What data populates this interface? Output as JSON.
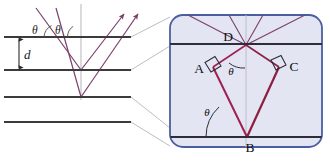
{
  "figure": {
    "colors": {
      "plane_line": "#3b3b3b",
      "ray": "#7b3f6b",
      "ray_dark": "#8c2244",
      "normal": "#b9b9bd",
      "panel_border": "#4a5fa0",
      "panel_fill": "#e2e4f2",
      "leader": "#b0b0b8",
      "text": "#1a1a1a"
    },
    "left_panel": {
      "name": "crystal-planes-diagram",
      "spacing_label": "d",
      "incident_angle_label_1": "θ",
      "incident_angle_label_2": "θ",
      "plane_count": 4,
      "incoming_ray_count": 2,
      "outgoing_ray_count": 2,
      "normal_line": "vertical dashed normal"
    },
    "right_panel": {
      "name": "magnified-path-difference-detail",
      "points": [
        {
          "id": "A",
          "label": "A"
        },
        {
          "id": "B",
          "label": "B"
        },
        {
          "id": "C",
          "label": "C"
        },
        {
          "id": "D",
          "label": "D"
        }
      ],
      "angle_labels": [
        {
          "id": "theta-top",
          "label": "θ"
        },
        {
          "id": "theta-bottom",
          "label": "θ"
        }
      ],
      "right_angle_markers": 2,
      "plane_count": 2
    }
  }
}
